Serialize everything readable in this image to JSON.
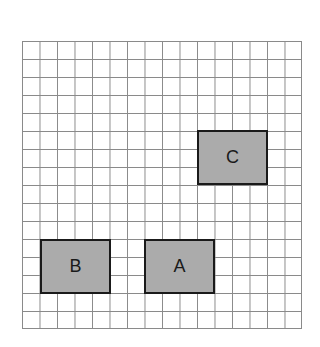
{
  "diagram": {
    "grid": {
      "columns": 16,
      "rows": 16,
      "line_color": "#8a8a8a"
    },
    "boxes": [
      {
        "label": "C",
        "col": 10,
        "row": 5,
        "width_cells": 4,
        "height_cells": 3,
        "fill": "#ababab"
      },
      {
        "label": "B",
        "col": 1,
        "row": 11,
        "width_cells": 4,
        "height_cells": 3,
        "fill": "#ababab"
      },
      {
        "label": "A",
        "col": 7,
        "row": 11,
        "width_cells": 4,
        "height_cells": 3,
        "fill": "#ababab"
      }
    ]
  }
}
